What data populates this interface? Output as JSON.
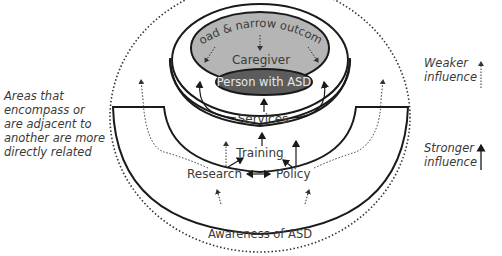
{
  "diagram": {
    "type": "nested-influence-diagram",
    "nodes": {
      "outcomes": "Broad & narrow outcomes",
      "caregiver": "Caregiver",
      "person": "Person with ASD",
      "services": "Services",
      "training": "Training",
      "research": "Research",
      "policy": "Policy",
      "awareness": "Awareness of ASD"
    },
    "edges": [
      {
        "from": "outcomes",
        "to": "caregiver",
        "style": "dotted"
      },
      {
        "from": "services",
        "to": "person",
        "style": "solid"
      },
      {
        "from": "training",
        "to": "services",
        "style": "solid"
      },
      {
        "from": "research",
        "to": "policy",
        "style": "solid-bidirectional"
      },
      {
        "from": "awareness",
        "to": "research",
        "style": "dotted"
      },
      {
        "from": "awareness",
        "to": "policy",
        "style": "dotted"
      }
    ],
    "colors": {
      "outer_ellipse_fill": "#b5b5b5",
      "inner_ellipse_fill": "#5c5c5c",
      "line": "#1a1a1a",
      "text": "#3a3a3a",
      "inner_text": "#e8e8e8"
    }
  },
  "annotations": {
    "left_note": [
      "Areas that",
      "encompass or",
      "are adjacent to",
      "another are more",
      "directly related"
    ],
    "weaker": [
      "Weaker",
      "influence"
    ],
    "stronger": [
      "Stronger",
      "influence"
    ]
  }
}
